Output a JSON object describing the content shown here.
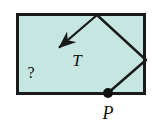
{
  "figure": {
    "caption_type": "geometry-vector-diagram",
    "background_color": "#ffffff",
    "rectangle": {
      "fill_color": "#c6e7e1",
      "border_color": "#1a1a1a",
      "border_width": 3,
      "x": 16,
      "y": 13,
      "width": 130,
      "height": 82
    },
    "vector": {
      "name": "T",
      "label": "T",
      "color": "#1a1a1a",
      "stroke_width": 2.2,
      "tail_x": 97,
      "tail_y": 15,
      "tip_x": 47,
      "tip_y": 58,
      "label_x": 77,
      "label_y": 66,
      "label_font_size": 17
    },
    "segments": [
      {
        "name": "apex-to-right-vertex",
        "x1": 97,
        "y1": 15,
        "x2": 146,
        "y2": 60,
        "color": "#1a1a1a",
        "stroke_width": 2.4
      },
      {
        "name": "right-vertex-to-point-p",
        "x1": 146,
        "y1": 60,
        "x2": 108,
        "y2": 93,
        "color": "#1a1a1a",
        "stroke_width": 2.4
      }
    ],
    "point": {
      "name": "P",
      "label": "P",
      "x": 108,
      "y": 93,
      "radius": 5,
      "color": "#111111",
      "label_x": 108,
      "label_y": 119,
      "label_font_size": 18
    },
    "unknown_marker": {
      "label": "?",
      "x": 31,
      "y": 78,
      "font_size": 16
    }
  }
}
